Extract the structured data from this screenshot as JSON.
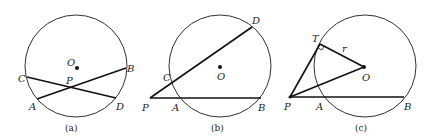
{
  "figures": [
    {
      "id": "a",
      "caption": "(a)",
      "circle": {
        "cx": 76,
        "cy": 66,
        "r": 51
      },
      "center_label": "O",
      "labels": {
        "O": "O",
        "P": "P",
        "A": "A",
        "B": "B",
        "C": "C",
        "D": "D"
      },
      "description": "Two chords AB and CD intersecting at interior point P"
    },
    {
      "id": "b",
      "caption": "(b)",
      "circle": {
        "cx": 220,
        "cy": 66,
        "r": 51
      },
      "center_label": "O",
      "labels": {
        "O": "O",
        "P": "P",
        "A": "A",
        "B": "B",
        "C": "C",
        "D": "D"
      },
      "description": "Two secants PAB and PCD from exterior point P"
    },
    {
      "id": "c",
      "caption": "(c)",
      "circle": {
        "cx": 365,
        "cy": 66,
        "r": 51
      },
      "center_label": "O",
      "labels": {
        "O": "O",
        "P": "P",
        "A": "A",
        "B": "B",
        "T": "T",
        "r": "r"
      },
      "description": "Tangent PT and secant PAB from exterior point P, with radius OT = r and right angle at T"
    }
  ]
}
